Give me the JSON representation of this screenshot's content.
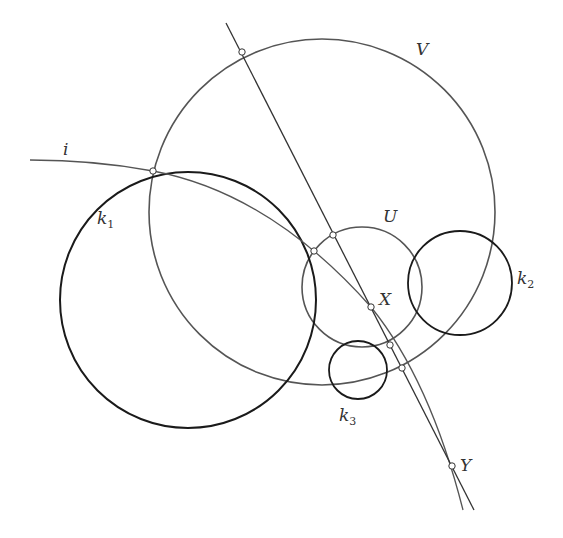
{
  "diagram": {
    "type": "geometric-construction",
    "colors": {
      "background": "#ffffff",
      "dark_stroke": "#1a1a1a",
      "gray_stroke": "#555555",
      "point_fill": "#ffffff"
    },
    "circles": [
      {
        "id": "k1",
        "label": "k",
        "sub": "1",
        "cx": 188,
        "cy": 300,
        "r": 128,
        "style": "dark"
      },
      {
        "id": "V",
        "label": "V",
        "cx": 322,
        "cy": 212,
        "r": 173,
        "style": "gray"
      },
      {
        "id": "U",
        "label": "U",
        "cx": 362,
        "cy": 287,
        "r": 60,
        "style": "gray"
      },
      {
        "id": "k2",
        "label": "k",
        "sub": "2",
        "cx": 460,
        "cy": 283,
        "r": 52,
        "style": "dark"
      },
      {
        "id": "k3",
        "label": "k",
        "sub": "3",
        "cx": 358,
        "cy": 370,
        "r": 29,
        "style": "dark"
      }
    ],
    "labels": {
      "i": "i",
      "V": "V",
      "U": "U",
      "X": "X",
      "Y": "Y",
      "k1_main": "k",
      "k1_sub": "1",
      "k2_main": "k",
      "k2_sub": "2",
      "k3_main": "k",
      "k3_sub": "3"
    },
    "points": [
      {
        "name": "V-top-intersection",
        "x": 242,
        "y": 52
      },
      {
        "name": "i-k1-V-intersection",
        "x": 153,
        "y": 171
      },
      {
        "name": "U-line-intersection",
        "x": 333,
        "y": 235
      },
      {
        "name": "U-k1-intersection",
        "x": 314,
        "y": 251
      },
      {
        "name": "X",
        "x": 371,
        "y": 307
      },
      {
        "name": "U-bottom-intersection",
        "x": 390,
        "y": 345
      },
      {
        "name": "V-bottom-intersection",
        "x": 402,
        "y": 368
      },
      {
        "name": "Y",
        "x": 452,
        "y": 466
      }
    ]
  }
}
